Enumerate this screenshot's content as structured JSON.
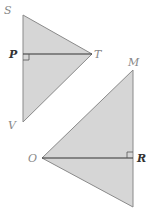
{
  "figure": {
    "colors": {
      "fill": "#d6d6d6",
      "stroke": "#8a8a8a",
      "segment": "#333333"
    },
    "triangle_1": {
      "vertices": {
        "S": [
          23,
          15
        ],
        "T": [
          92,
          54
        ],
        "V": [
          23,
          122
        ]
      },
      "foot": {
        "P": [
          23,
          54
        ]
      },
      "labels": {
        "S": "S",
        "P": "P",
        "T": "T",
        "V": "V"
      }
    },
    "triangle_2": {
      "vertices": {
        "M": [
          133,
          70
        ],
        "O": [
          42,
          158
        ],
        "B": [
          133,
          207
        ]
      },
      "foot": {
        "R": [
          133,
          158
        ]
      },
      "labels": {
        "M": "M",
        "O": "O",
        "R": "R"
      }
    }
  }
}
